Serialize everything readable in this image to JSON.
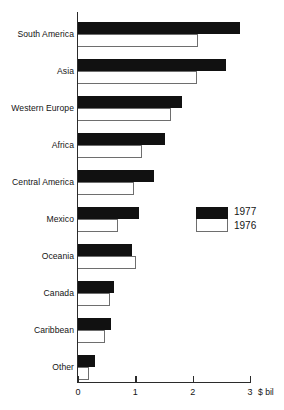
{
  "chart_data": {
    "type": "bar",
    "orientation": "horizontal",
    "title": "",
    "xlabel": "$ bil",
    "ylabel": "",
    "xlim": [
      0,
      3
    ],
    "xticks": [
      "0",
      "1",
      "2",
      "3"
    ],
    "xtick_values": [
      0,
      1,
      2,
      3
    ],
    "grid": false,
    "legend_position": "middle-right",
    "categories": [
      "South America",
      "Asia",
      "Western Europe",
      "Africa",
      "Central America",
      "Mexico",
      "Oceania",
      "Canada",
      "Caribbean",
      "Other"
    ],
    "series": [
      {
        "name": "1977",
        "color": "#111111",
        "values": [
          2.83,
          2.58,
          1.82,
          1.51,
          1.33,
          1.06,
          0.95,
          0.63,
          0.57,
          0.3
        ]
      },
      {
        "name": "1976",
        "color": "#ffffff",
        "values": [
          2.09,
          2.08,
          1.62,
          1.11,
          0.97,
          0.69,
          1.01,
          0.56,
          0.47,
          0.2
        ]
      }
    ]
  },
  "legend": {
    "items": [
      {
        "label": "1977",
        "swatch": "filled-black-swatch"
      },
      {
        "label": "1976",
        "swatch": "outlined-white-swatch"
      }
    ]
  },
  "axis": {
    "unit_label": "$ bil"
  }
}
